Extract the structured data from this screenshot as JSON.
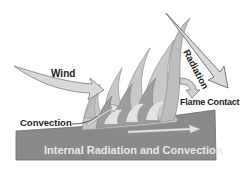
{
  "diagram": {
    "labels": {
      "wind": "Wind",
      "radiation": "Radiation",
      "flame_contact": "Flame Contact",
      "convection": "Convection",
      "internal": "Internal Radiation and Convection"
    },
    "colors": {
      "background": "#ffffff",
      "fuel_block": "#8a8a8a",
      "fuel_block_edge": "#6e6e6e",
      "flame_light": "#d2d2d2",
      "flame_mid": "#b4b4b4",
      "flame_dark": "#8f8f8f",
      "arrow_fill": "#d9d9d9",
      "arrow_stroke": "#7a7a7a",
      "label_text": "#222222",
      "internal_text": "#e8e8e8"
    }
  }
}
